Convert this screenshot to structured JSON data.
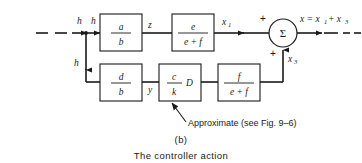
{
  "figure": {
    "panel_label": "(b)",
    "caption": "The controller action",
    "annotation": "Approximate (see Fig. 9–6)"
  },
  "signals": {
    "input_h": "h",
    "branch_top_h": "h",
    "branch_down_h": "h",
    "z": "z",
    "x1_base": "x",
    "x1_sub": "1",
    "y": "y",
    "x3_base": "x",
    "x3_sub": "3",
    "output_expr_lead": "x = x",
    "output_sub1": "1",
    "output_plus": "+ x",
    "output_sub3": "3"
  },
  "summer": {
    "symbol": "Σ",
    "sign_top": "+",
    "sign_bottom": "+"
  },
  "blocks": [
    {
      "name": "block-a-over-b",
      "numerator": "a",
      "denominator": "b",
      "suffix": ""
    },
    {
      "name": "block-e-over-e-f",
      "numerator": "e",
      "denominator": "e + f",
      "suffix": ""
    },
    {
      "name": "block-d-over-b",
      "numerator": "d",
      "denominator": "b",
      "suffix": ""
    },
    {
      "name": "block-c-over-k-D",
      "numerator": "c",
      "denominator": "k",
      "suffix": "D"
    },
    {
      "name": "block-f-over-e-f",
      "numerator": "f",
      "denominator": "e + f",
      "suffix": ""
    }
  ],
  "colors": {
    "ink": "#1a1a1a",
    "paper": "#ffffff"
  }
}
